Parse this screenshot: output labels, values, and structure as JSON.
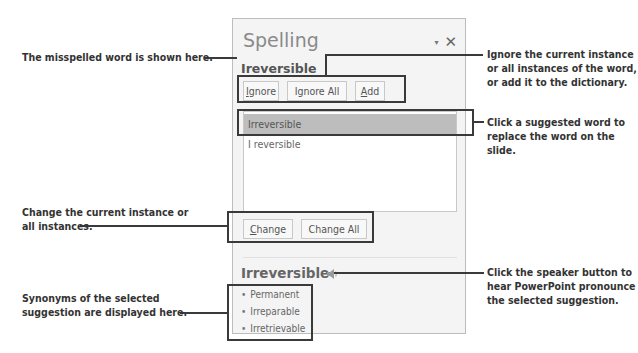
{
  "pane": {
    "title": "Spelling",
    "dropdown_icon": "▾",
    "close_icon": "✕",
    "misspelled_word": "Ireversible",
    "buttons": {
      "ignore": "gnore",
      "ignore_accel": "I",
      "ignore_all": "Ignore All",
      "add_accel": "A",
      "add": "dd",
      "change_accel": "C",
      "change": "hange",
      "change_all": "Change All"
    },
    "suggestions": [
      {
        "label": "Irreversible",
        "selected": true
      },
      {
        "label": "I reversible",
        "selected": false
      }
    ],
    "synonym_heading": "Irreversible",
    "synonyms": [
      "Permanent",
      "Irreparable",
      "Irretrievable"
    ]
  },
  "callouts": {
    "misspelled": "The misspelled word is shown here.",
    "ignore": "Ignore the current instance or all instances of the word, or add it to the dictionary.",
    "suggestion": "Click a suggested word to replace the word on the slide.",
    "change": "Change the current instance or all instances.",
    "speaker": "Click the speaker button to hear PowerPoint pronounce the selected suggestion.",
    "synonyms": "Synonyms of the selected suggestion are displayed here."
  },
  "colors": {
    "frame": "#3a3a3a",
    "pane_bg": "#f4f4f4",
    "selection": "#bdbdbd"
  }
}
